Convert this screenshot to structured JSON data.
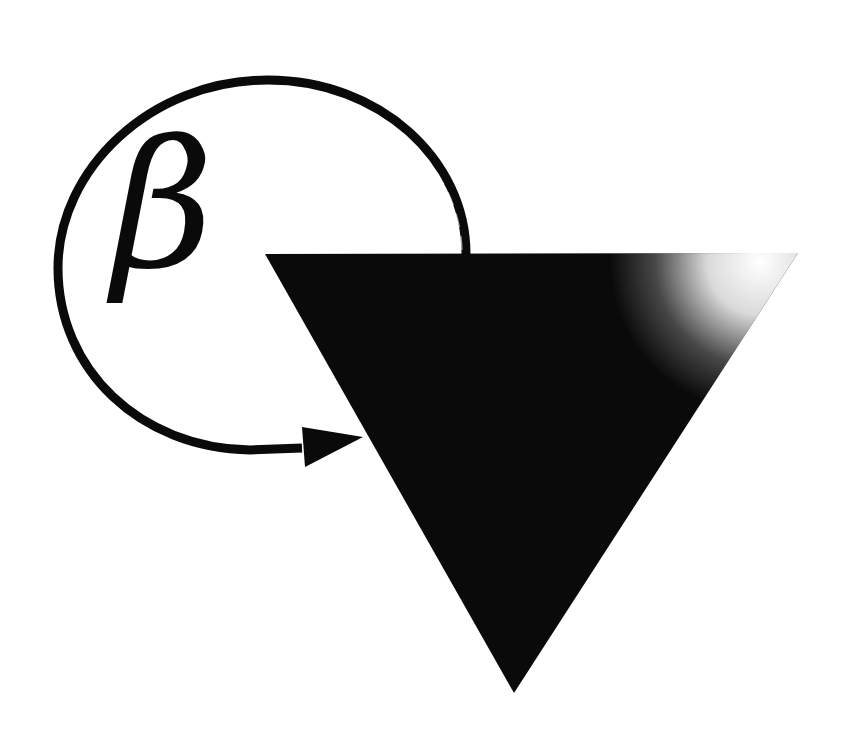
{
  "diagram": {
    "title": "",
    "symbol": {
      "label": "β",
      "meaning": "feedback-factor"
    },
    "shapes": {
      "triangle": {
        "orientation": "pointing-down",
        "fill": "#0a0a0a",
        "highlight": "#ffffff",
        "points": [
          [
            265,
            254
          ],
          [
            798,
            253
          ],
          [
            514,
            693
          ]
        ]
      },
      "feedback_loop": {
        "stroke": "#0a0a0a",
        "stroke_width": 9,
        "start": [
          467,
          254
        ],
        "end": [
          302,
          448
        ],
        "arrowhead_tip": [
          363,
          437
        ]
      }
    },
    "background": "#ffffff"
  }
}
